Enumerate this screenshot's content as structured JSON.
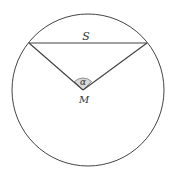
{
  "diagram": {
    "labels": {
      "chord": "S",
      "angle": "α",
      "center": "M"
    },
    "colors": {
      "stroke": "#444444",
      "angle_fill": "#d9d9d9",
      "text": "#333333",
      "background": "#ffffff"
    }
  }
}
